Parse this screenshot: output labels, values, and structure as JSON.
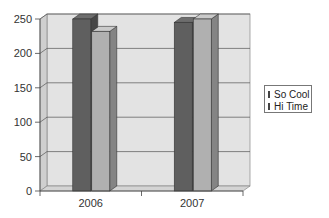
{
  "chart_data": {
    "type": "bar",
    "style": "3d-clustered-column",
    "title": "",
    "xlabel": "",
    "ylabel": "",
    "categories": [
      "2006",
      "2007"
    ],
    "series": [
      {
        "name": "So Cool",
        "values": [
          250,
          245
        ],
        "color": "#5f5f5f"
      },
      {
        "name": "Hi Time",
        "values": [
          232,
          250
        ],
        "color": "#b0b0b0"
      }
    ],
    "ylim": [
      0,
      250
    ],
    "yticks": [
      0,
      50,
      100,
      150,
      200,
      250
    ],
    "grid": true,
    "legend_position": "right"
  },
  "legend": {
    "items": [
      {
        "label": "So Cool",
        "color": "#5f5f5f"
      },
      {
        "label": "Hi Time",
        "color": "#b0b0b0"
      }
    ]
  },
  "colors": {
    "wall": "#e3e3e3",
    "floor": "#d4d4d4",
    "gridline": "#555555"
  }
}
